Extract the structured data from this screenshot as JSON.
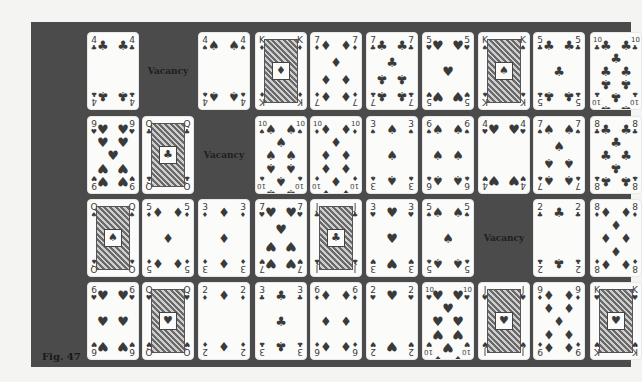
{
  "figure": {
    "caption": "Fig. 47",
    "vacancy_label": "Vacancy",
    "colors": {
      "panel": "#4b4b4b",
      "card": "#fbfbfa",
      "ink": "#3a3a3a",
      "page": "#f4f4f2"
    }
  },
  "layout": {
    "columns_x": [
      87,
      142,
      198,
      255,
      310,
      366,
      422,
      478,
      533,
      590
    ],
    "rows_y": [
      32,
      116,
      199,
      282
    ]
  },
  "rows": [
    {
      "cards": [
        {
          "rank": "4",
          "suit": "♣"
        },
        {
          "vacancy": true
        },
        {
          "rank": "4",
          "suit": "♠"
        },
        {
          "rank": "K",
          "suit": "♦",
          "face": true
        },
        {
          "rank": "7",
          "suit": "♦"
        },
        {
          "rank": "7",
          "suit": "♣"
        },
        {
          "rank": "5",
          "suit": "♥"
        },
        {
          "rank": "K",
          "suit": "♠",
          "face": true
        },
        {
          "rank": "5",
          "suit": "♣"
        },
        {
          "rank": "10",
          "suit": "♣",
          "partial": true
        }
      ]
    },
    {
      "cards": [
        {
          "rank": "9",
          "suit": "♥"
        },
        {
          "rank": "Q",
          "suit": "♣",
          "face": true
        },
        {
          "vacancy": true
        },
        {
          "rank": "10",
          "suit": "♠"
        },
        {
          "rank": "10",
          "suit": "♦"
        },
        {
          "rank": "3",
          "suit": "♠"
        },
        {
          "rank": "6",
          "suit": "♠"
        },
        {
          "rank": "4",
          "suit": "♥"
        },
        {
          "rank": "7",
          "suit": "♠"
        },
        {
          "rank": "8",
          "suit": "♣",
          "partial": true
        }
      ]
    },
    {
      "cards": [
        {
          "rank": "Q",
          "suit": "♠",
          "face": true
        },
        {
          "rank": "5",
          "suit": "♦"
        },
        {
          "rank": "3",
          "suit": "♦"
        },
        {
          "rank": "7",
          "suit": "♥"
        },
        {
          "rank": "J",
          "suit": "♣",
          "face": true
        },
        {
          "rank": "3",
          "suit": "♥"
        },
        {
          "rank": "5",
          "suit": "♠"
        },
        {
          "vacancy": true
        },
        {
          "rank": "2",
          "suit": "♣"
        },
        {
          "rank": "8",
          "suit": "♦",
          "partial": true
        }
      ]
    },
    {
      "cards": [
        {
          "rank": "6",
          "suit": "♥"
        },
        {
          "rank": "Q",
          "suit": "♥",
          "face": true
        },
        {
          "rank": "2",
          "suit": "♦"
        },
        {
          "rank": "3",
          "suit": "♣"
        },
        {
          "rank": "6",
          "suit": "♦"
        },
        {
          "rank": "2",
          "suit": "♥"
        },
        {
          "rank": "10",
          "suit": "♥"
        },
        {
          "rank": "J",
          "suit": "♥",
          "face": true
        },
        {
          "rank": "9",
          "suit": "♦"
        },
        {
          "rank": "K",
          "suit": "♥",
          "face": true,
          "partial": true
        }
      ]
    }
  ]
}
